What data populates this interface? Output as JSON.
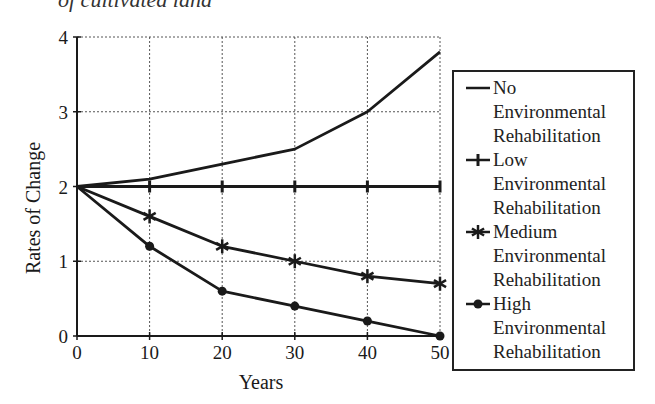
{
  "caption_clipped": "of cultivated land",
  "chart_data": {
    "type": "line",
    "title": "",
    "xlabel": "Years",
    "ylabel": "Rates of Change",
    "x": [
      0,
      10,
      20,
      30,
      40,
      50
    ],
    "xticks": [
      "0",
      "10",
      "20",
      "30",
      "40",
      "50"
    ],
    "yticks": [
      "0",
      "1",
      "2",
      "3",
      "4"
    ],
    "xlim": [
      0,
      50
    ],
    "ylim": [
      0,
      4
    ],
    "grid": true,
    "legend_position": "right",
    "series": [
      {
        "name": "No Environmental Rehabilitation",
        "marker": "none",
        "values": [
          2.0,
          2.1,
          2.3,
          2.5,
          3.0,
          3.8
        ]
      },
      {
        "name": "Low Environmental Rehabilitation",
        "marker": "plus",
        "values": [
          2.0,
          2.0,
          2.0,
          2.0,
          2.0,
          2.0
        ]
      },
      {
        "name": "Medium Environmental Rehabilitation",
        "marker": "star",
        "values": [
          2.0,
          1.6,
          1.2,
          1.0,
          0.8,
          0.7
        ]
      },
      {
        "name": "High Environmental Rehabilitation",
        "marker": "dot",
        "values": [
          2.0,
          1.2,
          0.6,
          0.4,
          0.2,
          0.0
        ]
      }
    ]
  },
  "legend": {
    "items": [
      {
        "lines": [
          "No",
          "Environmental",
          "Rehabilitation"
        ],
        "symbol": "dash"
      },
      {
        "lines": [
          "Low",
          "Environmental",
          "Rehabilitation"
        ],
        "symbol": "plus"
      },
      {
        "lines": [
          "Medium",
          "Environmental",
          "Rehabilitation"
        ],
        "symbol": "star"
      },
      {
        "lines": [
          "High",
          "Environmental",
          "Rehabilitation"
        ],
        "symbol": "dot"
      }
    ]
  },
  "colors": {
    "ink": "#1a1a1a",
    "grid": "#555555",
    "background": "#ffffff"
  }
}
